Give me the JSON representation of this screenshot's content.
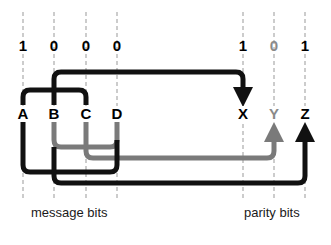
{
  "diagram": {
    "type": "parity-bit coverage diagram",
    "colors": {
      "primary": "#111111",
      "secondary": "#7a7a7a",
      "guide": "#999999"
    },
    "columns": [
      {
        "id": "A",
        "x": 23,
        "bit": "1",
        "group": "message",
        "color": "#111111"
      },
      {
        "id": "B",
        "x": 54,
        "bit": "0",
        "group": "message",
        "color": "#111111"
      },
      {
        "id": "C",
        "x": 86,
        "bit": "0",
        "group": "message",
        "color": "#111111"
      },
      {
        "id": "D",
        "x": 117,
        "bit": "0",
        "group": "message",
        "color": "#111111"
      },
      {
        "id": "X",
        "x": 243,
        "bit": "1",
        "group": "parity",
        "color": "#111111"
      },
      {
        "id": "Y",
        "x": 274,
        "bit": "0",
        "group": "parity",
        "color": "#7a7a7a"
      },
      {
        "id": "Z",
        "x": 305,
        "bit": "1",
        "group": "parity",
        "color": "#111111"
      }
    ],
    "captions": {
      "message": "message bits",
      "parity": "parity bits"
    },
    "connections": [
      {
        "parity": "X",
        "from": [
          "A",
          "B",
          "C"
        ],
        "color": "black"
      },
      {
        "parity": "Y",
        "from": [
          "B",
          "C",
          "D"
        ],
        "color": "gray"
      },
      {
        "parity": "Z",
        "from": [
          "A",
          "B",
          "D"
        ],
        "color": "black"
      }
    ]
  }
}
